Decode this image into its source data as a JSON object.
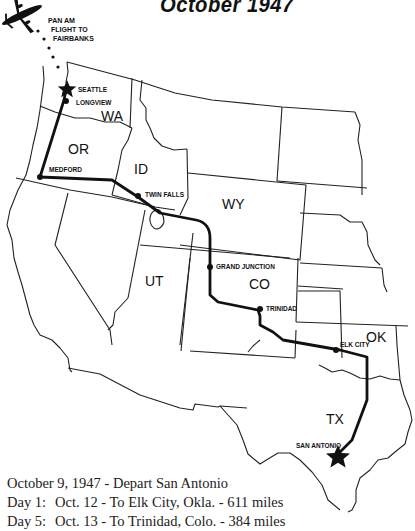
{
  "title": "October 1947",
  "flight_note": {
    "lines": [
      "PAN AM",
      "FLIGHT TO",
      "FAIRBANKS"
    ]
  },
  "states": {
    "wa": "WA",
    "or": "OR",
    "id": "ID",
    "wy": "WY",
    "ut": "UT",
    "co": "CO",
    "ok": "OK",
    "tx": "TX"
  },
  "cities": {
    "seattle": "SEATTLE",
    "longview": "LONGVIEW",
    "medford": "MEDFORD",
    "twin_falls": "TWIN FALLS",
    "grand_junction": "GRAND JUNCTION",
    "trinidad": "TRINIDAD",
    "elk_city": "ELK CITY",
    "san_antonio": "SAN ANTONIO"
  },
  "legend": {
    "rows": [
      {
        "day": "",
        "text": "October 9, 1947 - Depart San Antonio"
      },
      {
        "day": "Day 1:",
        "text": "Oct. 12 - To Elk City, Okla. - 611 miles"
      },
      {
        "day": "Day 5:",
        "text": "Oct. 13 - To Trinidad, Colo. - 384 miles"
      }
    ]
  },
  "colors": {
    "route": "#111111",
    "borders": "#222222",
    "background": "#ffffff"
  }
}
